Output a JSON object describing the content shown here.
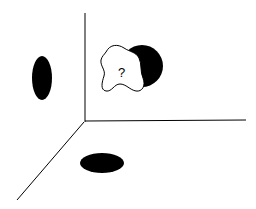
{
  "diagram": {
    "unknown_object_label": "?",
    "colors": {
      "background": "#ffffff",
      "stroke": "#000000",
      "fill": "#000000"
    },
    "axes": [
      "vertical",
      "horizontal",
      "depth"
    ],
    "projections": [
      "left-wall ellipse",
      "floor ellipse",
      "back-wall circle"
    ]
  }
}
